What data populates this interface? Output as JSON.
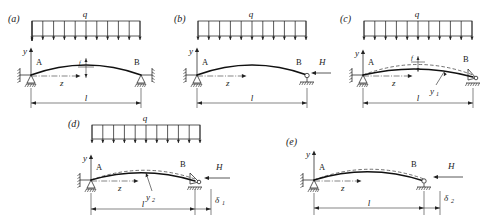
{
  "figure": {
    "load_symbol": "q",
    "span_symbol": "l",
    "axis_y": "y",
    "axis_z": "z",
    "node_left": "A",
    "node_right": "B",
    "force_symbol": "H",
    "rise_symbol": "f",
    "load_arrow_count": 11
  },
  "panels": [
    {
      "id": "a",
      "tag": "(a)",
      "load_label": "q",
      "axis_y": "y",
      "axis_z": "z",
      "node_left": "A",
      "node_right": "B",
      "span_label": "l",
      "rise_label": "f",
      "has_force": false,
      "force_label": "",
      "has_ghost_curve": false,
      "curve_label": "",
      "delta_label": "",
      "left_support": "pinned-spring",
      "right_support": "pinned-spring"
    },
    {
      "id": "b",
      "tag": "(b)",
      "load_label": "q",
      "axis_y": "y",
      "axis_z": "z",
      "node_left": "A",
      "node_right": "B",
      "span_label": "l",
      "rise_label": "",
      "has_force": true,
      "force_label": "H",
      "has_ghost_curve": false,
      "curve_label": "",
      "delta_label": "",
      "left_support": "pinned-spring",
      "right_support": "roller"
    },
    {
      "id": "c",
      "tag": "(c)",
      "load_label": "q",
      "axis_y": "y",
      "axis_z": "z",
      "node_left": "A",
      "node_right": "B",
      "span_label": "l",
      "rise_label": "f",
      "has_force": false,
      "force_label": "",
      "has_ghost_curve": true,
      "curve_label": "y",
      "curve_sub": "1",
      "delta_label": "",
      "left_support": "pinned-spring",
      "right_support": "pin-triangle"
    },
    {
      "id": "d",
      "tag": "(d)",
      "load_label": "q",
      "axis_y": "y",
      "axis_z": "z",
      "node_left": "A",
      "node_right": "B",
      "span_label": "l",
      "rise_label": "",
      "has_force": true,
      "force_label": "H",
      "has_ghost_curve": true,
      "curve_label": "y",
      "curve_sub": "2",
      "delta_label": "δ",
      "delta_sub": "1",
      "left_support": "pinned-spring",
      "right_support": "pin-triangle"
    },
    {
      "id": "e",
      "tag": "(e)",
      "load_label": "",
      "axis_y": "y",
      "axis_z": "z",
      "node_left": "A",
      "node_right": "B",
      "span_label": "l",
      "rise_label": "",
      "has_force": true,
      "force_label": "H",
      "has_ghost_curve": true,
      "curve_label": "",
      "delta_label": "δ",
      "delta_sub": "2",
      "left_support": "pinned-spring",
      "right_support": "roller"
    }
  ]
}
